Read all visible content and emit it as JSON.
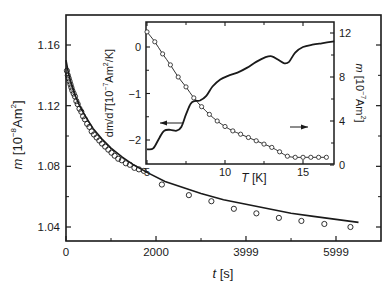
{
  "chart_data": [
    {
      "id": "main",
      "type": "line+scatter",
      "title": "",
      "xlabel": "t [s]",
      "ylabel": "m [10^-8 Am^2]",
      "xlim": [
        0,
        6990
      ],
      "ylim": [
        1.03,
        1.18
      ],
      "x_ticks": [
        {
          "value": 0,
          "label": "0"
        },
        {
          "value": 2000,
          "label": "2000"
        },
        {
          "value": 3999,
          "label": "3999"
        },
        {
          "value": 5999,
          "label": "5999"
        }
      ],
      "x_minor_ticks": [
        1000,
        3000,
        5000
      ],
      "y_ticks": [
        {
          "value": 1.04,
          "label": "1.04"
        },
        {
          "value": 1.08,
          "label": "1.08"
        },
        {
          "value": 1.12,
          "label": "1.12"
        },
        {
          "value": 1.16,
          "label": "1.16"
        }
      ],
      "y_minor_ticks": [
        1.06,
        1.1,
        1.14
      ],
      "grid": false,
      "series": [
        {
          "name": "fit",
          "style": "line",
          "x": [
            0,
            50,
            100,
            200,
            300,
            450,
            600,
            800,
            1000,
            1250,
            1500,
            1800,
            2200,
            2600,
            3000,
            3500,
            4000,
            4500,
            5000,
            5500,
            6000,
            6500
          ],
          "y": [
            1.15,
            1.142,
            1.136,
            1.127,
            1.12,
            1.112,
            1.105,
            1.098,
            1.092,
            1.086,
            1.081,
            1.076,
            1.07,
            1.066,
            1.062,
            1.058,
            1.055,
            1.052,
            1.049,
            1.047,
            1.045,
            1.043
          ]
        },
        {
          "name": "measured",
          "style": "open-circles",
          "x": [
            20,
            40,
            60,
            80,
            100,
            120,
            140,
            170,
            200,
            230,
            260,
            300,
            340,
            380,
            420,
            470,
            520,
            570,
            620,
            680,
            740,
            800,
            870,
            940,
            1010,
            1080,
            1160,
            1240,
            1330,
            1420,
            1520,
            1620,
            1730,
            2130,
            2730,
            3230,
            3730,
            4230,
            4730,
            5230,
            5740,
            6320
          ],
          "y": [
            1.143,
            1.14,
            1.138,
            1.136,
            1.134,
            1.132,
            1.13,
            1.128,
            1.126,
            1.123,
            1.121,
            1.118,
            1.116,
            1.113,
            1.111,
            1.108,
            1.106,
            1.103,
            1.101,
            1.099,
            1.097,
            1.095,
            1.093,
            1.091,
            1.089,
            1.087,
            1.085,
            1.084,
            1.082,
            1.081,
            1.079,
            1.078,
            1.077,
            1.068,
            1.061,
            1.057,
            1.052,
            1.049,
            1.046,
            1.044,
            1.042,
            1.04
          ]
        }
      ]
    },
    {
      "id": "inset",
      "type": "line",
      "xlabel": "T [K]",
      "ylabel_left": "dm/dT [10^-7 Am^2/K]",
      "ylabel_right": "m [10^-7 Am^2]",
      "xlim": [
        5,
        17
      ],
      "ylim_left": [
        -2.5,
        0.35
      ],
      "ylim_right": [
        0,
        12.9
      ],
      "x_ticks": [
        {
          "value": 5,
          "label": "5"
        },
        {
          "value": 10,
          "label": "10"
        },
        {
          "value": 15,
          "label": "15"
        }
      ],
      "x_minor_ticks": [
        7.5,
        12.5
      ],
      "y_left_ticks": [
        {
          "value": 0,
          "label": "0"
        },
        {
          "value": -1,
          "label": "−1"
        },
        {
          "value": -2,
          "label": "−2"
        }
      ],
      "y_left_minor_ticks": [
        -0.5,
        -1.5
      ],
      "y_right_ticks": [
        {
          "value": 0,
          "label": "0"
        },
        {
          "value": 4,
          "label": "4"
        },
        {
          "value": 8,
          "label": "8"
        },
        {
          "value": 12,
          "label": "12"
        }
      ],
      "y_right_minor_ticks": [
        2,
        6,
        10
      ],
      "series": [
        {
          "name": "dm/dT",
          "axis": "left",
          "style": "line",
          "x": [
            5.0,
            5.4,
            5.8,
            6.1,
            6.5,
            6.9,
            7.2,
            7.5,
            7.8,
            8.1,
            8.4,
            8.8,
            9.2,
            9.7,
            10.2,
            10.8,
            11.4,
            12.0,
            12.6,
            13.0,
            13.4,
            13.8,
            14.1,
            14.5,
            15.0,
            15.6,
            16.2,
            17.0
          ],
          "y": [
            -2.2,
            -2.18,
            -1.95,
            -1.8,
            -1.78,
            -1.8,
            -1.72,
            -1.45,
            -1.22,
            -1.16,
            -1.15,
            -1.05,
            -0.85,
            -0.7,
            -0.62,
            -0.55,
            -0.45,
            -0.32,
            -0.22,
            -0.2,
            -0.27,
            -0.35,
            -0.32,
            -0.12,
            0.0,
            0.05,
            0.08,
            0.12
          ]
        },
        {
          "name": "m",
          "axis": "right",
          "style": "line-open-circles",
          "x": [
            5.0,
            5.5,
            6.0,
            6.5,
            7.0,
            7.5,
            8.0,
            8.5,
            9.0,
            9.5,
            10.0,
            10.5,
            11.0,
            11.5,
            12.0,
            12.5,
            13.0,
            13.5,
            14.0,
            14.5,
            15.0,
            15.5,
            16.0,
            16.5
          ],
          "y": [
            12.1,
            11.2,
            10.1,
            9.1,
            8.0,
            7.1,
            6.1,
            5.3,
            4.6,
            4.0,
            3.5,
            3.1,
            2.8,
            2.5,
            2.2,
            1.9,
            1.6,
            1.2,
            0.8,
            0.7,
            0.7,
            0.7,
            0.7,
            0.7
          ]
        }
      ],
      "annotations": [
        {
          "type": "arrow",
          "direction": "left",
          "points_to": "left axis (dm/dT curve)",
          "at_T": 7.2,
          "at_value_left": -1.65
        },
        {
          "type": "arrow",
          "direction": "right",
          "points_to": "right axis (m curve)",
          "at_T": 11.5,
          "at_value_right": 3.2
        }
      ]
    }
  ],
  "labels": {
    "main_ylabel_italic": "m",
    "main_ylabel_rest": " [10",
    "main_ylabel_exp": "−8",
    "main_ylabel_unit": "Am",
    "main_ylabel_unit_exp": "2",
    "main_ylabel_close": "]",
    "main_xlabel_italic": "t",
    "main_xlabel_rest": " [s]",
    "inset_xlabel_italic": "T",
    "inset_xlabel_rest": " [K]",
    "inset_left_label_a": "dm/d",
    "inset_left_label_T": "T",
    "inset_left_label_b": "[10",
    "inset_left_label_exp": "−7",
    "inset_left_label_c": "Am",
    "inset_left_label_exp2": "2",
    "inset_left_label_d": "/K]",
    "inset_right_label_italic": "m",
    "inset_right_label_b": " [10",
    "inset_right_label_exp": "−7",
    "inset_right_label_c": "Am",
    "inset_right_label_exp2": "2",
    "inset_right_label_d": "]"
  },
  "colors": {
    "ink": "#1a1a1a",
    "background": "#ffffff"
  }
}
